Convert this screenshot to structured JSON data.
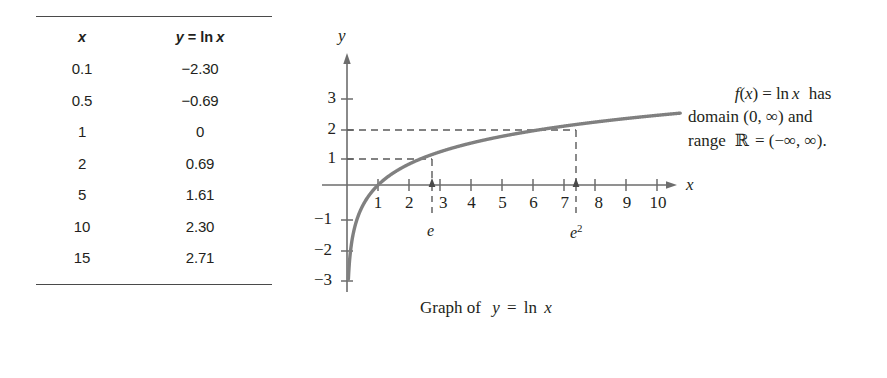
{
  "table": {
    "headers": {
      "x": "x",
      "y": "y = ln x",
      "y_lhs": "y",
      "y_eq": "=",
      "y_fn": "ln",
      "y_arg": "x"
    },
    "rows": [
      {
        "x": "0.1",
        "y": "−2.30"
      },
      {
        "x": "0.5",
        "y": "−0.69"
      },
      {
        "x": "1",
        "y": "0"
      },
      {
        "x": "2",
        "y": "0.69"
      },
      {
        "x": "5",
        "y": "1.61"
      },
      {
        "x": "10",
        "y": "2.30"
      },
      {
        "x": "15",
        "y": "2.71"
      }
    ]
  },
  "graph": {
    "axis_label_y": "y",
    "axis_label_x": "x",
    "x_ticks": [
      "1",
      "2",
      "3",
      "4",
      "5",
      "6",
      "7",
      "8",
      "9",
      "10"
    ],
    "y_ticks": [
      "3",
      "2",
      "1",
      "−1",
      "−2",
      "−3"
    ],
    "marker_e": "e",
    "marker_e2_base": "e",
    "marker_e2_exp": "2",
    "caption_pre": "Graph of",
    "caption_y": "y",
    "caption_eq": "=",
    "caption_fn": "ln",
    "caption_arg": "x",
    "curve_color": "#808080",
    "axis_color": "#6d6d6d"
  },
  "annotation": {
    "line1_fn": "f",
    "line1_paren_open": "(",
    "line1_var": "x",
    "line1_paren_close": ")",
    "line1_eq": "=",
    "line1_ln": "ln",
    "line1_arg": "x",
    "line1_tail": "has",
    "line2": "domain  (0, ∞)  and",
    "line3_pre": "range",
    "line3_R": "ℝ",
    "line3_post": "= (−∞, ∞)."
  },
  "chart_data": {
    "type": "line",
    "title": "Graph of y = ln x",
    "xlabel": "x",
    "ylabel": "y",
    "xlim": [
      0,
      10.7
    ],
    "ylim": [
      -3.4,
      3.4
    ],
    "function": "y = ln x",
    "grid": false,
    "legend": null,
    "table_points": {
      "x": [
        0.1,
        0.5,
        1,
        2,
        5,
        10,
        15
      ],
      "y": [
        -2.3,
        -0.69,
        0,
        0.69,
        1.61,
        2.3,
        2.71
      ]
    },
    "annotations": [
      {
        "label": "e",
        "x": 2.718,
        "y": 1,
        "dashed_to_axis": true
      },
      {
        "label": "e^2",
        "x": 7.389,
        "y": 2,
        "dashed_to_axis": true
      }
    ],
    "x_ticks": [
      1,
      2,
      3,
      4,
      5,
      6,
      7,
      8,
      9,
      10
    ],
    "y_ticks": [
      3,
      2,
      1,
      -1,
      -2,
      -3
    ]
  }
}
